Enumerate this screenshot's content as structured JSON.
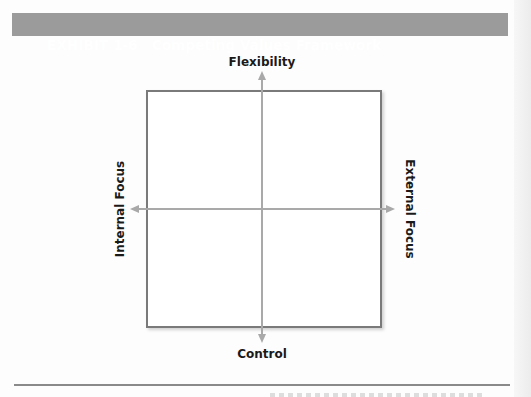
{
  "exhibit": {
    "number_label": "EXHIBIT 1-6",
    "title": "Competing Values Framework",
    "header_color": "#9b9b9b"
  },
  "diagram": {
    "axes": {
      "top": "Flexibility",
      "bottom": "Control",
      "left": "Internal Focus",
      "right": "External Focus"
    },
    "axis_color": "#a9a9a9",
    "box_border_color": "#7a7a7a"
  }
}
